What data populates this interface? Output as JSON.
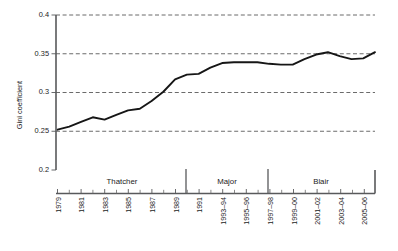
{
  "chart_data": {
    "type": "line",
    "title": "",
    "subtitle": "",
    "xlabel": "",
    "ylabel": "Gini coefficient",
    "ylim": [
      0.2,
      0.4
    ],
    "xlim": [
      1979,
      2006
    ],
    "grid": true,
    "grid_axis": "y",
    "legend": false,
    "legend_position": "none",
    "ytick_labels": [
      "0.2",
      "0.25",
      "0.3",
      "0.35",
      "0.4"
    ],
    "ytick_values": [
      0.2,
      0.25,
      0.3,
      0.35,
      0.4
    ],
    "xtick_labels": [
      "1979",
      "1981",
      "1983",
      "1985",
      "1987",
      "1989",
      "1991",
      "1993–94",
      "1995–96",
      "1997–98",
      "1999–00",
      "2001–02",
      "2003–04",
      "2005–06"
    ],
    "xtick_values": [
      1979,
      1981,
      1983,
      1985,
      1987,
      1989,
      1991,
      1993,
      1995,
      1997,
      1999,
      2001,
      2003,
      2005
    ],
    "x": [
      1979,
      1980,
      1981,
      1982,
      1983,
      1984,
      1985,
      1986,
      1987,
      1988,
      1989,
      1990,
      1991,
      1992,
      1993,
      1994,
      1995,
      1996,
      1997,
      1998,
      1999,
      2000,
      2001,
      2002,
      2003,
      2004,
      2005,
      2006
    ],
    "series": [
      {
        "name": "Gini coefficient",
        "values": [
          0.252,
          0.256,
          0.262,
          0.268,
          0.265,
          0.271,
          0.277,
          0.279,
          0.289,
          0.301,
          0.317,
          0.323,
          0.324,
          0.332,
          0.338,
          0.339,
          0.339,
          0.339,
          0.337,
          0.336,
          0.336,
          0.343,
          0.349,
          0.352,
          0.347,
          0.343,
          0.344,
          0.352
        ]
      }
    ],
    "annotations": [
      {
        "label": "Thatcher",
        "start": 1979,
        "end": 1990
      },
      {
        "label": "Major",
        "start": 1990,
        "end": 1997
      },
      {
        "label": "Blair",
        "start": 1997,
        "end": 2006
      }
    ],
    "colors": {
      "line": "#161616",
      "axis": "#58595b",
      "grid": "#5a5a5a",
      "background": "#ffffff"
    }
  },
  "axis": {
    "y_title": "Gini coefficient",
    "y_ticks": {
      "t0": "0.2",
      "t1": "0.25",
      "t2": "0.3",
      "t3": "0.35",
      "t4": "0.4"
    },
    "x_ticks": {
      "t0": "1979",
      "t1": "1981",
      "t2": "1983",
      "t3": "1985",
      "t4": "1987",
      "t5": "1989",
      "t6": "1991",
      "t7": "1993–94",
      "t8": "1995–96",
      "t9": "1997–98",
      "t10": "1999–00",
      "t11": "2001–02",
      "t12": "2003–04",
      "t13": "2005–06"
    }
  },
  "periods": {
    "thatcher": "Thatcher",
    "major": "Major",
    "blair": "Blair"
  }
}
